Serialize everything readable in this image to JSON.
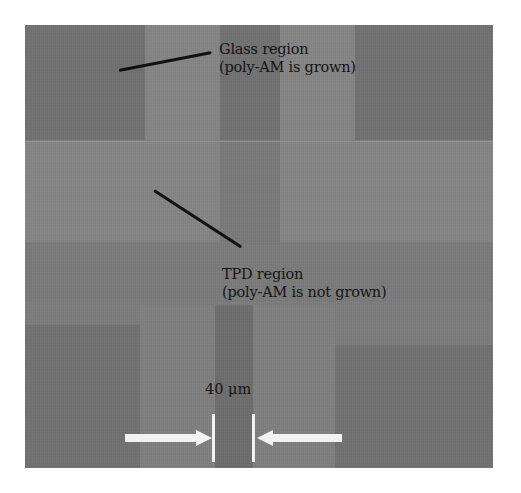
{
  "figure": {
    "type": "optical micrograph",
    "background_color": "#7d7d7d",
    "annotations": [
      {
        "id": "glass-region",
        "line1": "Glass region",
        "line2": "(poly-AM is grown)"
      },
      {
        "id": "tpd-region",
        "line1": "TPD region",
        "line2": "(poly-AM is not grown)"
      }
    ],
    "scale_bar": {
      "label": "40 μm",
      "value": 40,
      "unit": "μm",
      "arrow_color": "#f2f2f2"
    },
    "colors": {
      "pad": "#727272",
      "stripe": "#858585",
      "leader_line": "#111111",
      "text": "#141414"
    }
  }
}
